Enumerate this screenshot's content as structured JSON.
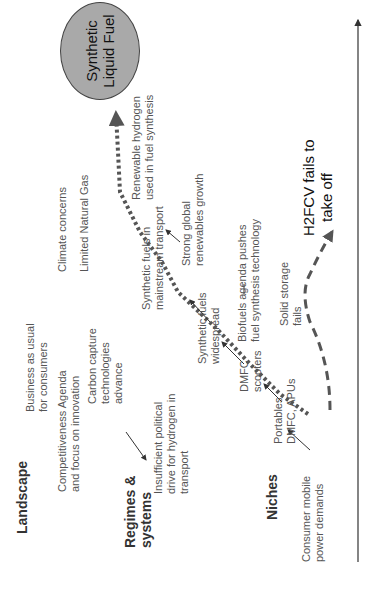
{
  "levels": {
    "landscape": "Landscape",
    "regimes": [
      "Regimes &",
      "systems"
    ],
    "niches": "Niches"
  },
  "goal": {
    "label": [
      "Synthetic",
      "Liquid Fuel"
    ],
    "fill_color": "#a9a9a9"
  },
  "landscape_items": {
    "competitiveness": [
      "Competitiveness Agenda",
      "and focus on innovation"
    ],
    "business_as_usual": [
      "Business as usual",
      "for consumers"
    ],
    "carbon_capture": [
      "Carbon capture",
      "technologies",
      "advance"
    ],
    "climate": "Climate concerns",
    "natural_gas": "Limited Natural Gas"
  },
  "regime_items": {
    "political": [
      "Insufficient political",
      "drive for hydrogen in",
      "transport"
    ],
    "synfuel_mainstream": [
      "Synthetic fuels in",
      "mainstream transport"
    ],
    "synfuel_widespread": [
      "Synthetic fuels",
      "widespread"
    ],
    "renewable_h2": [
      "Renewable hydrogen",
      "used in fuel synthesis"
    ],
    "renewables_growth": [
      "Strong global",
      "renewables growth"
    ],
    "biofuels": [
      "Biofuels agenda pushes",
      "fuel synthesis technology"
    ]
  },
  "niche_items": {
    "consumer": [
      "Consumer mobile",
      "power demands"
    ],
    "portables": [
      "Portables,",
      "DMFC, APUs"
    ],
    "dmfc_scooters": [
      "DMFC",
      "scooters"
    ],
    "solid_storage": [
      "Solid storage",
      "fails"
    ],
    "h2fcv": [
      "H2FCV fails to",
      "take off"
    ]
  },
  "axis": {
    "label": ""
  }
}
